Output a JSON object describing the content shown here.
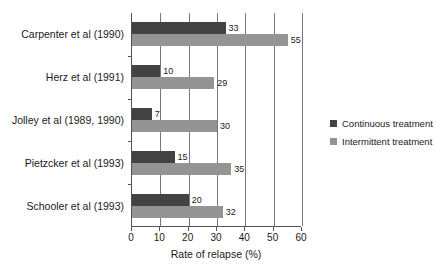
{
  "chart_data": {
    "type": "bar",
    "orientation": "horizontal",
    "title": "",
    "xlabel": "Rate of relapse (%)",
    "ylabel": "",
    "xlim": [
      0,
      60
    ],
    "xticks": [
      0,
      10,
      20,
      30,
      40,
      50,
      60
    ],
    "xtick_labels": [
      "0",
      "10",
      "20",
      "30",
      "40",
      "50",
      "60"
    ],
    "grid": true,
    "grid_axis": "x",
    "legend_position": "right",
    "categories": [
      "Carpenter et al (1990)",
      "Herz et al (1991)",
      "Jolley et al (1989, 1990)",
      "Pietzcker et al (1993)",
      "Schooler et al (1993)"
    ],
    "series": [
      {
        "name": "Continuous treatment",
        "color": "#434343",
        "values": [
          33,
          10,
          7,
          15,
          20
        ]
      },
      {
        "name": "Intermittent treatment",
        "color": "#949494",
        "values": [
          55,
          29,
          30,
          35,
          32
        ]
      }
    ]
  },
  "legend": {
    "items": [
      {
        "label": "Continuous treatment",
        "color": "#434343"
      },
      {
        "label": "Intermittent treatment",
        "color": "#949494"
      }
    ]
  },
  "axis": {
    "x_title": "Rate of relapse (%)"
  }
}
